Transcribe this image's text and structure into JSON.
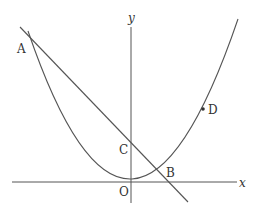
{
  "diagram": {
    "type": "coordinate-plane",
    "axes": {
      "x_label": "x",
      "y_label": "y",
      "origin_label": "O"
    },
    "curves": [
      {
        "name": "parabola",
        "description": "upward parabola with vertex at origin"
      },
      {
        "name": "line",
        "description": "line passing through A, C, B"
      }
    ],
    "points": {
      "A": "A",
      "B": "B",
      "C": "C",
      "D": "D"
    },
    "colors": {
      "stroke": "#444444",
      "text": "#333333",
      "background": "#ffffff"
    }
  }
}
